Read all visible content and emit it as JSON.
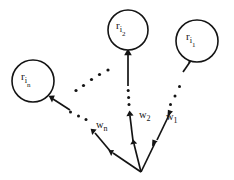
{
  "figure": {
    "background_color": "#ffffff",
    "stroke_color": "#141414"
  },
  "nodes": [
    {
      "id": "node-r-i-n",
      "base": "r",
      "sub_main": "i",
      "sub_sub": "n",
      "cx": 33,
      "cy": 81,
      "rx": 21,
      "ry": 21
    },
    {
      "id": "node-r-i-2",
      "base": "r",
      "sub_main": "i",
      "sub_sub": "2",
      "cx": 128,
      "cy": 30,
      "rx": 20,
      "ry": 20
    },
    {
      "id": "node-r-i-1",
      "base": "r",
      "sub_main": "i",
      "sub_sub": "1",
      "cx": 197,
      "cy": 41,
      "rx": 21,
      "ry": 21
    }
  ],
  "weights": [
    {
      "id": "weight-w-n",
      "base": "w",
      "sub": "n",
      "x": 96,
      "y": 128
    },
    {
      "id": "weight-w-2",
      "base": "w",
      "sub": "2",
      "x": 139,
      "y": 118
    },
    {
      "id": "weight-w-1",
      "base": "w",
      "sub": "1",
      "x": 166,
      "y": 120
    }
  ],
  "origin": {
    "label": "fan-out origin",
    "x": 141,
    "y": 172
  },
  "ellipsis_groups": [
    {
      "id": "ellipsis-diagonal-center",
      "orientation": "diagonal",
      "dot_count": 5
    },
    {
      "id": "ellipsis-vertical-w2",
      "orientation": "vertical",
      "dot_count": 4
    },
    {
      "id": "ellipsis-diagonal-w1",
      "orientation": "diagonal",
      "dot_count": 3
    },
    {
      "id": "ellipsis-horizontal-wn",
      "orientation": "horizontal",
      "dot_count": 3
    }
  ]
}
